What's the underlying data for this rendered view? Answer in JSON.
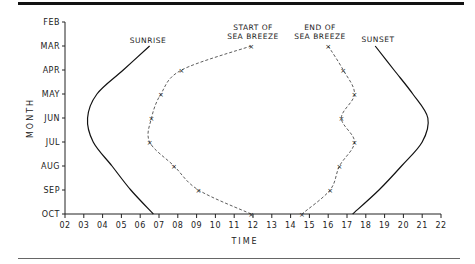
{
  "chart_data": {
    "type": "line",
    "title": "",
    "xlabel": "TIME",
    "ylabel": "MONTH",
    "xlim": [
      2,
      22
    ],
    "x_ticks": [
      "02",
      "03",
      "04",
      "05",
      "06",
      "07",
      "08",
      "09",
      "10",
      "11",
      "12",
      "13",
      "14",
      "15",
      "16",
      "17",
      "18",
      "19",
      "20",
      "21",
      "22"
    ],
    "y_categories": [
      "FEB",
      "MAR",
      "APR",
      "MAY",
      "JUN",
      "JUL",
      "AUG",
      "SEP",
      "OCT"
    ],
    "grid": false,
    "series": [
      {
        "name": "SUNRISE",
        "style": "solid",
        "markers": false,
        "points": [
          {
            "month": "MAR",
            "time": 6.5
          },
          {
            "month": "APR",
            "time": 5.1
          },
          {
            "month": "MAY",
            "time": 3.7
          },
          {
            "month": "JUN",
            "time": 3.2
          },
          {
            "month": "JUL",
            "time": 3.5
          },
          {
            "month": "AUG",
            "time": 4.5
          },
          {
            "month": "SEP",
            "time": 5.5
          },
          {
            "month": "OCT",
            "time": 6.7
          }
        ]
      },
      {
        "name": "START OF SEA BREEZE",
        "style": "dashed",
        "markers": true,
        "points": [
          {
            "month": "MAR",
            "time": 11.9
          },
          {
            "month": "APR",
            "time": 8.2
          },
          {
            "month": "MAY",
            "time": 7.1
          },
          {
            "month": "JUN",
            "time": 6.6
          },
          {
            "month": "JUL",
            "time": 6.5
          },
          {
            "month": "AUG",
            "time": 7.8
          },
          {
            "month": "SEP",
            "time": 9.1
          },
          {
            "month": "OCT",
            "time": 11.9
          }
        ]
      },
      {
        "name": "END OF SEA BREEZE",
        "style": "dashed",
        "markers": true,
        "points": [
          {
            "month": "MAR",
            "time": 16.0
          },
          {
            "month": "APR",
            "time": 16.8
          },
          {
            "month": "MAY",
            "time": 17.4
          },
          {
            "month": "JUN",
            "time": 16.7
          },
          {
            "month": "JUL",
            "time": 17.4
          },
          {
            "month": "AUG",
            "time": 16.6
          },
          {
            "month": "SEP",
            "time": 16.1
          },
          {
            "month": "OCT",
            "time": 14.6
          }
        ]
      },
      {
        "name": "SUNSET",
        "style": "solid",
        "markers": false,
        "points": [
          {
            "month": "MAR",
            "time": 18.5
          },
          {
            "month": "APR",
            "time": 19.5
          },
          {
            "month": "MAY",
            "time": 20.5
          },
          {
            "month": "JUN",
            "time": 21.3
          },
          {
            "month": "JUL",
            "time": 21.0
          },
          {
            "month": "AUG",
            "time": 19.9
          },
          {
            "month": "SEP",
            "time": 18.7
          },
          {
            "month": "OCT",
            "time": 17.3
          }
        ]
      }
    ],
    "annotations": [
      {
        "series": "SUNRISE",
        "lines": [
          "SUNRISE"
        ]
      },
      {
        "series": "START OF SEA BREEZE",
        "lines": [
          "START OF",
          "SEA BREEZE"
        ]
      },
      {
        "series": "END OF SEA BREEZE",
        "lines": [
          "END OF",
          "SEA BREEZE"
        ]
      },
      {
        "series": "SUNSET",
        "lines": [
          "SUNSET"
        ]
      }
    ]
  }
}
